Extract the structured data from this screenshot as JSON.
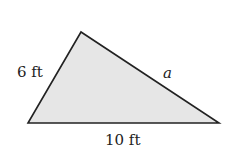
{
  "diagram": {
    "shape": "triangle",
    "fill_color": "#e6e6e6",
    "stroke_color": "#222222",
    "vertices": {
      "bottom_left": [
        28,
        123
      ],
      "top": [
        81,
        32
      ],
      "bottom_right": [
        219,
        123
      ]
    },
    "labels": {
      "left_side": "6 ft",
      "right_side": "a",
      "bottom_side": "10 ft"
    }
  }
}
